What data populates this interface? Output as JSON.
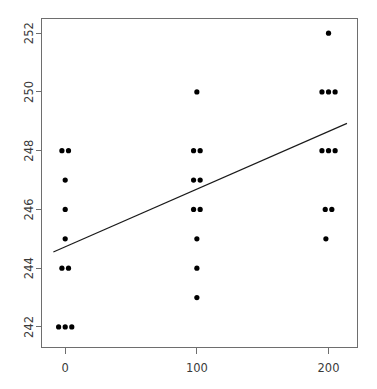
{
  "chart_data": {
    "type": "scatter",
    "title": "",
    "subtitle": "",
    "xlabel": "",
    "ylabel": "",
    "xlim": [
      -18,
      222
    ],
    "ylim": [
      241.3,
      252.5
    ],
    "grid": false,
    "legend": null,
    "xticks": [
      0,
      100,
      200
    ],
    "xtick_labels": [
      "0",
      "100",
      "200"
    ],
    "yticks": [
      242,
      244,
      246,
      248,
      250,
      252
    ],
    "ytick_labels": [
      "242",
      "244",
      "246",
      "248",
      "250",
      "252"
    ],
    "point_style": {
      "marker": "filled-circle",
      "radius_px": 2.6,
      "color": "#000000"
    },
    "jitter_note": "x values jittered slightly around 0, 100, 200",
    "points": [
      {
        "x": -2.5,
        "y": 248
      },
      {
        "x": 2.5,
        "y": 248
      },
      {
        "x": 0,
        "y": 247
      },
      {
        "x": 0,
        "y": 246
      },
      {
        "x": 0,
        "y": 245
      },
      {
        "x": -2.5,
        "y": 244
      },
      {
        "x": 2.5,
        "y": 244
      },
      {
        "x": -5,
        "y": 242
      },
      {
        "x": 0,
        "y": 242
      },
      {
        "x": 5,
        "y": 242
      },
      {
        "x": 100,
        "y": 250
      },
      {
        "x": 97.5,
        "y": 248
      },
      {
        "x": 102.5,
        "y": 248
      },
      {
        "x": 97.5,
        "y": 247
      },
      {
        "x": 102.5,
        "y": 247
      },
      {
        "x": 97.5,
        "y": 246
      },
      {
        "x": 102.5,
        "y": 246
      },
      {
        "x": 100,
        "y": 245
      },
      {
        "x": 100,
        "y": 244
      },
      {
        "x": 100,
        "y": 243
      },
      {
        "x": 200,
        "y": 252
      },
      {
        "x": 195,
        "y": 250
      },
      {
        "x": 200,
        "y": 250
      },
      {
        "x": 205,
        "y": 250
      },
      {
        "x": 195,
        "y": 248
      },
      {
        "x": 200,
        "y": 248
      },
      {
        "x": 205,
        "y": 248
      },
      {
        "x": 197.5,
        "y": 246
      },
      {
        "x": 202.5,
        "y": 246
      },
      {
        "x": 198,
        "y": 245
      }
    ],
    "fit_line": {
      "name": "regression-line",
      "x_start": -9,
      "y_start": 244.55,
      "x_end": 214,
      "y_end": 248.93,
      "slope": 0.01964,
      "intercept": 244.73,
      "color": "#1a1a1a"
    },
    "colors": {
      "background": "#ffffff",
      "frame": "#6e6e6e",
      "tick_label": "#3a3a3a",
      "point": "#000000",
      "line": "#1a1a1a"
    }
  }
}
